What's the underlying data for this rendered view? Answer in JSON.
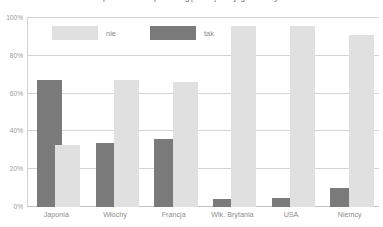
{
  "chart_data": {
    "type": "bar",
    "title": "powinno brać pod uwagę szczęście jego rodziny.",
    "xlabel": "",
    "ylabel": "",
    "ylim": [
      0,
      100
    ],
    "grid": true,
    "legend_position": "top-left",
    "categories": [
      "Japonia",
      "Włochy",
      "Francja",
      "Wlk. Brytania",
      "USA",
      "Niemcy"
    ],
    "ytick_labels": [
      "0%",
      "20%",
      "40%",
      "60%",
      "80%",
      "100%"
    ],
    "ytick_values": [
      0,
      20,
      40,
      60,
      80,
      100
    ],
    "series": [
      {
        "name": "nie",
        "color": "#e0e0e0",
        "values": [
          33,
          67,
          66,
          96,
          96,
          91
        ]
      },
      {
        "name": "tak",
        "color": "#7a7a7a",
        "values": [
          67,
          34,
          36,
          4,
          5,
          10
        ]
      }
    ],
    "bar_order_per_group": [
      [
        "tak",
        "nie"
      ],
      [
        "tak",
        "nie"
      ],
      [
        "tak",
        "nie"
      ],
      [
        "tak",
        "nie"
      ],
      [
        "tak",
        "nie"
      ],
      [
        "tak",
        "nie"
      ]
    ]
  }
}
